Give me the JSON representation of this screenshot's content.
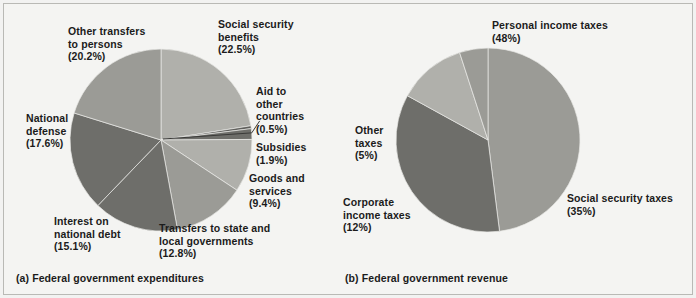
{
  "figure": {
    "background_color": "#f4f4f2",
    "border_color": "#b9b9b5"
  },
  "palette": {
    "light": "#b0b0ab",
    "medium": "#9b9b96",
    "dark": "#6e6e6a",
    "darker": "#5f5f5c",
    "line": "#3a3a38"
  },
  "panels": [
    {
      "id": "expenditures",
      "caption": "(a) Federal government expenditures",
      "center": {
        "x": 161,
        "y": 140
      },
      "radius": 91
    },
    {
      "id": "revenue",
      "caption": "(b) Federal government revenue",
      "center": {
        "x": 488,
        "y": 140
      },
      "radius": 92
    }
  ],
  "chart_data": [
    {
      "type": "pie",
      "title": "(a) Federal government expenditures",
      "start_angle_deg": 0,
      "direction": "clockwise",
      "labels": [
        "Social security benefits",
        "Aid to other countries",
        "Subsidies",
        "Goods and services",
        "Transfers to state and local governments",
        "Interest on national debt",
        "National defense",
        "Other transfers to persons"
      ],
      "values": [
        22.5,
        0.5,
        1.9,
        9.4,
        12.8,
        15.1,
        17.6,
        20.2
      ],
      "value_suffix": "%",
      "colors": [
        "#b0b0ab",
        "#5f5f5c",
        "#6e6e6a",
        "#b0b0ab",
        "#9b9b96",
        "#6e6e6a",
        "#6e6e6a",
        "#9b9b96"
      ],
      "slice_labels": [
        {
          "name": "social-security-benefits",
          "line1": "Social security",
          "line2": "benefits",
          "line3": "(22.5%)",
          "x": 218,
          "y": 18,
          "align": "left"
        },
        {
          "name": "aid-to-other-countries",
          "line1": "Aid to",
          "line2": "other",
          "line3": "countries",
          "line4": "(0.5%)",
          "x": 256,
          "y": 85,
          "align": "left"
        },
        {
          "name": "subsidies",
          "line1": "Subsidies",
          "line2": "(1.9%)",
          "x": 256,
          "y": 141,
          "align": "left"
        },
        {
          "name": "goods-and-services",
          "line1": "Goods and",
          "line2": "services",
          "line3": "(9.4%)",
          "x": 249,
          "y": 172,
          "align": "left"
        },
        {
          "name": "transfers-to-state-and-local-governments",
          "line1": "Transfers to state and",
          "line2": "local governments",
          "line3": "(12.8%)",
          "x": 159,
          "y": 222,
          "align": "left"
        },
        {
          "name": "interest-on-national-debt",
          "line1": "Interest on",
          "line2": "national debt",
          "line3": "(15.1%)",
          "x": 54,
          "y": 215,
          "align": "left"
        },
        {
          "name": "national-defense",
          "line1": "National",
          "line2": "defense",
          "line3": "(17.6%)",
          "x": 26,
          "y": 112,
          "align": "left"
        },
        {
          "name": "other-transfers-to-persons",
          "line1": "Other transfers",
          "line2": "to persons",
          "line3": "(20.2%)",
          "x": 68,
          "y": 25,
          "align": "left"
        }
      ],
      "xlabel": "",
      "ylabel": "",
      "legend": "none",
      "grid": false
    },
    {
      "type": "pie",
      "title": "(b) Federal government revenue",
      "start_angle_deg": 0,
      "direction": "clockwise",
      "labels": [
        "Personal income taxes",
        "Social security taxes",
        "Corporate income taxes",
        "Other taxes"
      ],
      "values": [
        48,
        35,
        12,
        5
      ],
      "value_suffix": "%",
      "colors": [
        "#9b9b96",
        "#6e6e6a",
        "#b0b0ab",
        "#9b9b96"
      ],
      "slice_labels": [
        {
          "name": "personal-income-taxes",
          "line1": "Personal income taxes",
          "line2": "(48%)",
          "x": 492,
          "y": 19,
          "align": "left"
        },
        {
          "name": "social-security-taxes",
          "line1": "Social security taxes",
          "line2": "(35%)",
          "x": 567,
          "y": 192,
          "align": "left"
        },
        {
          "name": "corporate-income-taxes",
          "line1": "Corporate",
          "line2": "income taxes",
          "line3": "(12%)",
          "x": 343,
          "y": 196,
          "align": "left"
        },
        {
          "name": "other-taxes",
          "line1": "Other",
          "line2": "taxes",
          "line3": "(5%)",
          "x": 355,
          "y": 124,
          "align": "left"
        }
      ],
      "xlabel": "",
      "ylabel": "",
      "legend": "none",
      "grid": false
    }
  ]
}
